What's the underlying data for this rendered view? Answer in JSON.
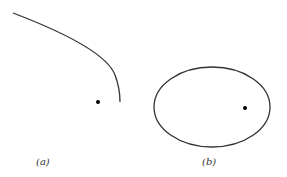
{
  "figures": [
    {
      "label": "(a)",
      "shape": "parabolic-arc",
      "focus_dot": true
    },
    {
      "label": "(b)",
      "shape": "ellipse",
      "focus_dot": true
    }
  ],
  "colors": {
    "stroke": "#333333",
    "dot": "#000000"
  }
}
